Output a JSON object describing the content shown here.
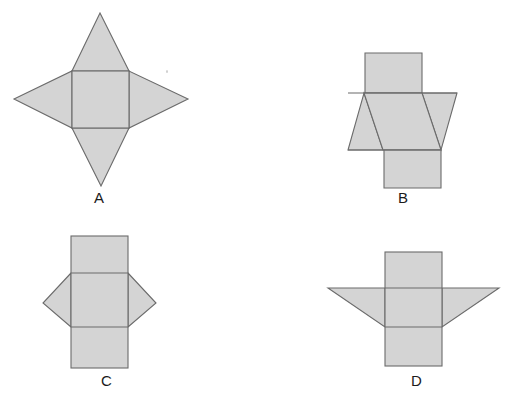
{
  "figure": {
    "background_color": "#ffffff",
    "shape_fill": "#d4d4d4",
    "shape_stroke": "#6b6b6b",
    "label_color": "#1b1b1b"
  },
  "options": [
    {
      "id": "A",
      "label": "A",
      "description": "Square with four triangles forming a four-pointed star",
      "label_x": 94,
      "label_y": 197,
      "square": {
        "left": 72,
        "top": 71,
        "right": 129,
        "bottom": 128
      },
      "polygons": [
        {
          "name": "triangle-top",
          "points": "72,71 129,71 100,13"
        },
        {
          "name": "triangle-bottom",
          "points": "72,128 129,128 101,186"
        },
        {
          "name": "triangle-left",
          "points": "72,71 72,128 14,99"
        },
        {
          "name": "triangle-right",
          "points": "129,71 129,128 188,99"
        }
      ]
    },
    {
      "id": "B",
      "label": "B",
      "description": "Central band with offset top and bottom squares and two triangles",
      "label_x": 398,
      "label_y": 197,
      "polygons": [
        {
          "name": "square-top",
          "points": "365,53 422,53 422,93 365,93"
        },
        {
          "name": "square-bottom",
          "points": "384,150 441,150 441,188 384,188"
        },
        {
          "name": "band-middle",
          "points": "348,93 457,93 441,150 364,150"
        },
        {
          "name": "triangle-left",
          "points": "364,93 383,150 348,150"
        },
        {
          "name": "triangle-right",
          "points": "422,93 457,93 441,150"
        }
      ]
    },
    {
      "id": "C",
      "label": "C",
      "description": "Vertical strip of three squares with left and right triangles on the middle square",
      "label_x": 101,
      "label_y": 380,
      "rect": {
        "left": 71,
        "top": 236,
        "right": 128,
        "bottom": 368
      },
      "dividers": [
        273,
        327
      ],
      "polygons": [
        {
          "name": "triangle-left",
          "points": "71,273 71,327 43,303"
        },
        {
          "name": "triangle-right",
          "points": "128,273 128,327 156,303"
        }
      ]
    },
    {
      "id": "D",
      "label": "D",
      "description": "Vertical strip of three squares with two wing triangles angled downward",
      "label_x": 411,
      "label_y": 380,
      "rect": {
        "left": 385,
        "top": 252,
        "right": 442,
        "bottom": 366
      },
      "dividers": [
        288,
        327
      ],
      "polygons": [
        {
          "name": "triangle-left",
          "points": "328,288 385,288 385,327"
        },
        {
          "name": "triangle-right",
          "points": "442,288 499,288 442,327"
        }
      ]
    }
  ],
  "marks": [
    {
      "name": "speck-dot",
      "x": 166,
      "y": 70
    }
  ]
}
